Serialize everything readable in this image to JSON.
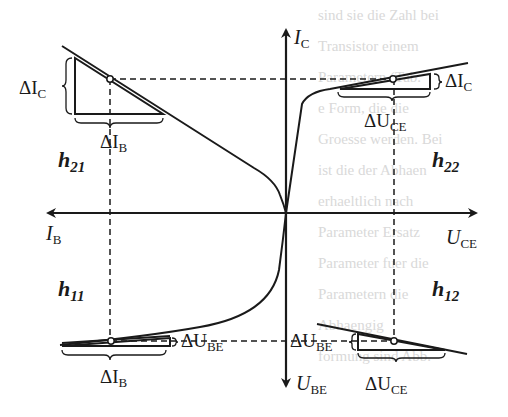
{
  "figure": {
    "axes": {
      "up": {
        "symbol": "I",
        "sub": "C"
      },
      "left": {
        "symbol": "I",
        "sub": "B"
      },
      "right": {
        "symbol": "U",
        "sub": "CE"
      },
      "down": {
        "symbol": "U",
        "sub": "BE"
      }
    },
    "quadrants": {
      "top_left": {
        "param": {
          "symbol": "h",
          "sub": "21"
        },
        "delta_v": {
          "symbol": "ΔI",
          "sub": "C"
        },
        "delta_h": {
          "symbol": "ΔI",
          "sub": "B"
        }
      },
      "top_right": {
        "param": {
          "symbol": "h",
          "sub": "22"
        },
        "delta_v": {
          "symbol": "ΔI",
          "sub": "C"
        },
        "delta_h": {
          "symbol": "ΔU",
          "sub": "CE"
        }
      },
      "bottom_left": {
        "param": {
          "symbol": "h",
          "sub": "11"
        },
        "delta_v": {
          "symbol": "ΔU",
          "sub": "BE"
        },
        "delta_h": {
          "symbol": "ΔI",
          "sub": "B"
        }
      },
      "bottom_right": {
        "param": {
          "symbol": "h",
          "sub": "12"
        },
        "delta_v": {
          "symbol": "ΔU",
          "sub": "BE"
        },
        "delta_h": {
          "symbol": "ΔU",
          "sub": "CE"
        }
      }
    },
    "colors": {
      "ink": "#1a1a1a",
      "bleed_text": "#d9d9d9"
    }
  },
  "background_bleed_text": [
    "sind sie die Zahl bei",
    "Transistor einem",
    "Parametern (Tab.",
    "e Form, die die",
    "Groesse werden. Bei",
    "ist die der Abhaen",
    "erhaeltlich nach",
    "Parameter Ersatz",
    "Parameter fuer die",
    "Parametern die",
    "Abhaengig",
    "formung sind Abb."
  ]
}
